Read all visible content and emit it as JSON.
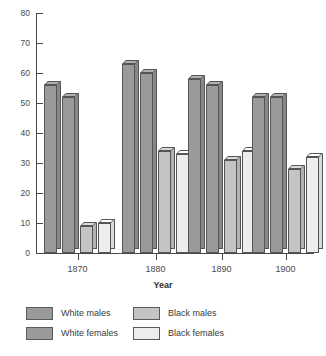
{
  "chart_data": {
    "type": "bar",
    "title": "",
    "subtitle": "",
    "xlabel": "Year",
    "ylabel": "",
    "categories": [
      "1870",
      "1880",
      "1890",
      "1900"
    ],
    "series": [
      {
        "name": "White males",
        "values": [
          56,
          63,
          58,
          52
        ],
        "color": "#9a9a9a"
      },
      {
        "name": "White females",
        "values": [
          52,
          60,
          56,
          52
        ],
        "color": "#9a9a9a"
      },
      {
        "name": "Black males",
        "values": [
          9,
          34,
          31,
          28
        ],
        "color": "#c4c4c4"
      },
      {
        "name": "Black females",
        "values": [
          10,
          33,
          34,
          32
        ],
        "color": "#ededed"
      }
    ],
    "ylim": [
      0,
      80
    ],
    "yticks": [
      0,
      10,
      20,
      30,
      40,
      50,
      60,
      70,
      80
    ],
    "ytick_labels": [
      "0",
      "10",
      "20",
      "30",
      "40",
      "50",
      "60",
      "70",
      "80"
    ],
    "grid": false,
    "legend_position": "bottom",
    "style": "3d-bars"
  },
  "legend": {
    "entries": [
      {
        "label": "White males",
        "color": "#9a9a9a"
      },
      {
        "label": "Black males",
        "color": "#c4c4c4"
      },
      {
        "label": "White females",
        "color": "#9a9a9a"
      },
      {
        "label": "Black females",
        "color": "#ededed"
      }
    ]
  },
  "axes": {
    "x_title": "Year"
  }
}
